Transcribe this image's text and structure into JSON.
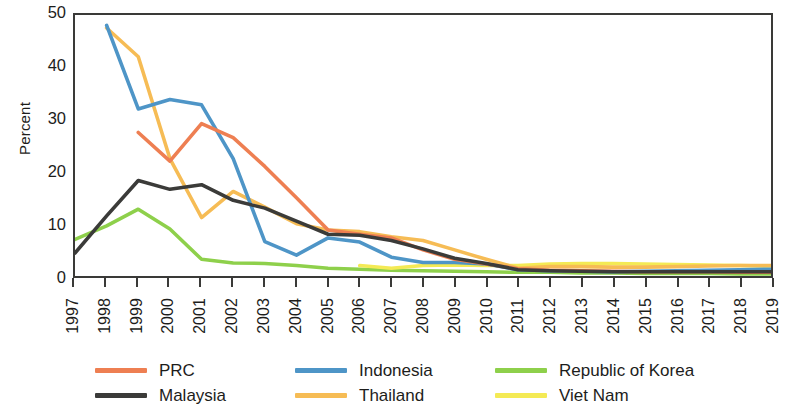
{
  "chart_data": {
    "type": "line",
    "title": "",
    "xlabel": "",
    "ylabel": "Percent",
    "ylim": [
      0,
      50
    ],
    "yticks": [
      0,
      10,
      20,
      30,
      40,
      50
    ],
    "ytick_labels": [
      "0",
      "10",
      "20",
      "30",
      "40",
      "50"
    ],
    "grid": false,
    "legend_position": "bottom",
    "x": [
      1997,
      1998,
      1999,
      2000,
      2001,
      2002,
      2003,
      2004,
      2005,
      2006,
      2007,
      2008,
      2009,
      2010,
      2011,
      2012,
      2013,
      2014,
      2015,
      2016,
      2017,
      2018,
      2019
    ],
    "xtick_labels": [
      "1997",
      "1998",
      "1999",
      "2000",
      "2001",
      "2002",
      "2003",
      "2004",
      "2005",
      "2006",
      "2007",
      "2008",
      "2009",
      "2010",
      "2011",
      "2012",
      "2013",
      "2014",
      "2015",
      "2016",
      "2017",
      "2018",
      "2019"
    ],
    "series": [
      {
        "name": "PRC",
        "color": "#EE7F52",
        "values": [
          null,
          null,
          27.5,
          22.0,
          29.2,
          26.5,
          21.0,
          15.0,
          8.8,
          8.0,
          7.3,
          5.0,
          3.2,
          2.3,
          1.4,
          1.1,
          1.0,
          0.9,
          0.8,
          0.8,
          0.8,
          0.7,
          0.7
        ]
      },
      {
        "name": "Indonesia",
        "color": "#4E95C7",
        "values": [
          null,
          48.0,
          32.0,
          33.8,
          32.8,
          22.5,
          6.6,
          4.0,
          7.3,
          6.5,
          3.6,
          2.6,
          2.6,
          2.3,
          1.2,
          1.0,
          0.9,
          0.8,
          0.9,
          1.0,
          1.1,
          1.2,
          1.3
        ]
      },
      {
        "name": "Republic of Korea",
        "color": "#8ED04B",
        "values": [
          7.0,
          9.6,
          12.8,
          9.0,
          3.2,
          2.5,
          2.4,
          2.0,
          1.5,
          1.3,
          1.1,
          1.0,
          0.9,
          0.8,
          0.7,
          0.7,
          0.6,
          0.6,
          0.5,
          0.5,
          0.5,
          0.4,
          0.4
        ]
      },
      {
        "name": "Malaysia",
        "color": "#3B3B39",
        "values": [
          4.4,
          11.5,
          18.3,
          16.6,
          17.5,
          14.5,
          13.0,
          10.5,
          8.0,
          7.8,
          6.8,
          5.2,
          3.4,
          2.4,
          1.2,
          1.0,
          0.9,
          0.8,
          0.8,
          0.8,
          0.8,
          0.8,
          0.8
        ]
      },
      {
        "name": "Thailand",
        "color": "#F6BC55",
        "values": [
          null,
          47.5,
          42.0,
          22.5,
          11.2,
          16.2,
          13.2,
          10.0,
          8.8,
          8.5,
          7.5,
          6.8,
          5.0,
          3.2,
          1.5,
          1.8,
          1.8,
          1.7,
          1.7,
          1.8,
          1.9,
          2.0,
          2.0
        ]
      },
      {
        "name": "Viet Nam",
        "color": "#F4EA55",
        "values": [
          null,
          null,
          null,
          null,
          null,
          null,
          null,
          null,
          null,
          2.0,
          1.5,
          2.0,
          2.1,
          2.0,
          2.0,
          2.3,
          2.4,
          2.4,
          2.3,
          2.2,
          2.1,
          2.0,
          1.9
        ]
      }
    ]
  },
  "axes": {
    "y_title": "Percent"
  },
  "legend": {
    "items": [
      {
        "label": "PRC",
        "color": "#EE7F52"
      },
      {
        "label": "Indonesia",
        "color": "#4E95C7"
      },
      {
        "label": "Republic of Korea",
        "color": "#8ED04B"
      },
      {
        "label": "Malaysia",
        "color": "#3B3B39"
      },
      {
        "label": "Thailand",
        "color": "#F6BC55"
      },
      {
        "label": "Viet Nam",
        "color": "#F4EA55"
      }
    ]
  }
}
